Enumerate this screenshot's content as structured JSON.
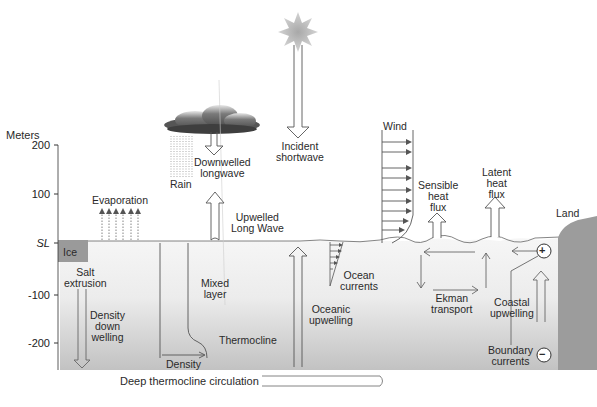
{
  "axis": {
    "title": "Meters",
    "ticks": [
      "200",
      "100",
      "SL",
      "-100",
      "-200"
    ]
  },
  "atmosphere": {
    "evaporation": "Evaporation",
    "rain": "Rain",
    "downwelled": "Downwelled\nlongwave",
    "upwelled": "Upwelled\nLong Wave",
    "incident": "Incident\nshortwave",
    "wind": "Wind",
    "sensible": "Sensible\nheat\nflux",
    "latent": "Latent\nheat\nflux",
    "land": "Land"
  },
  "ocean": {
    "ice": "Ice",
    "salt": "Salt\nextrusion",
    "density_down": "Density\ndown\nwelling",
    "mixed": "Mixed\nlayer",
    "density": "Density",
    "thermocline": "Thermocline",
    "oceanic_up": "Oceanic\nupwelling",
    "ocean_currents": "Ocean\ncurrents",
    "ekman": "Ekman\ntransport",
    "coastal": "Coastal\nupwelling",
    "boundary": "Boundary\ncurrents",
    "plus": "+",
    "minus": "−"
  },
  "footer": {
    "deep": "Deep thermocline circulation"
  },
  "colors": {
    "ocean_top": "#f4f4f4",
    "ocean_bottom": "#c4c4c4",
    "ice": "#9a9a9a",
    "land": "#9c9c9c",
    "line": "#555555"
  }
}
